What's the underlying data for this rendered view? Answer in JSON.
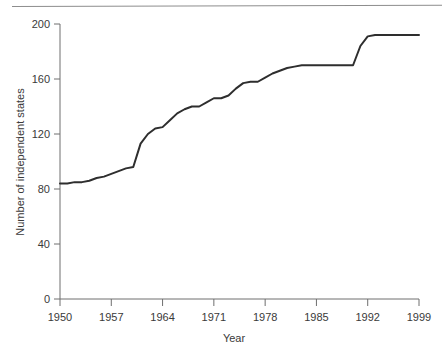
{
  "figure": {
    "background_color": "#ffffff",
    "line_color": "#2e2e2e",
    "axis_color": "#6e6e6e",
    "top_rule": "horizontal-rule"
  },
  "chart_data": {
    "type": "line",
    "title": "",
    "subtitle": "",
    "xlabel": "Year",
    "ylabel": "Number of independent states",
    "xlim": [
      1950,
      1999
    ],
    "ylim": [
      0,
      200
    ],
    "grid": false,
    "legend": null,
    "xticks": [
      1950,
      1957,
      1964,
      1971,
      1978,
      1985,
      1992,
      1999
    ],
    "xtick_labels": [
      "1950",
      "1957",
      "1964",
      "1971",
      "1978",
      "1985",
      "1992",
      "1999"
    ],
    "yticks": [
      0,
      40,
      80,
      120,
      160,
      200
    ],
    "ytick_labels": [
      "0",
      "40",
      "80",
      "120",
      "160",
      "200"
    ],
    "series": [
      {
        "name": "Number of independent states",
        "x": [
          1950,
          1951,
          1952,
          1953,
          1954,
          1955,
          1956,
          1957,
          1958,
          1959,
          1960,
          1961,
          1962,
          1963,
          1964,
          1965,
          1966,
          1967,
          1968,
          1969,
          1970,
          1971,
          1972,
          1973,
          1974,
          1975,
          1976,
          1977,
          1978,
          1979,
          1980,
          1981,
          1982,
          1983,
          1984,
          1985,
          1986,
          1987,
          1988,
          1989,
          1990,
          1991,
          1992,
          1993,
          1994,
          1995,
          1996,
          1997,
          1998,
          1999
        ],
        "y": [
          84,
          84,
          85,
          85,
          86,
          88,
          89,
          91,
          93,
          95,
          96,
          113,
          120,
          124,
          125,
          130,
          135,
          138,
          140,
          140,
          143,
          146,
          146,
          148,
          153,
          157,
          158,
          158,
          161,
          164,
          166,
          168,
          169,
          170,
          170,
          170,
          170,
          170,
          170,
          170,
          170,
          184,
          191,
          192,
          192,
          192,
          192,
          192,
          192,
          192
        ]
      }
    ],
    "annotations": []
  }
}
